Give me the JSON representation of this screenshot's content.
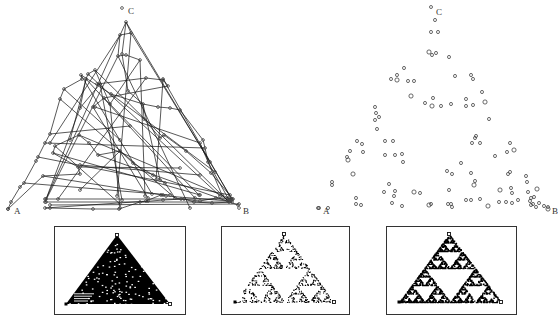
{
  "figure": {
    "left_panel": {
      "title": "Chaos game with connecting lines",
      "vertices": {
        "A": {
          "label": "A",
          "x": 8,
          "y": 209,
          "label_x": 14,
          "label_y": 214
        },
        "B": {
          "label": "B",
          "x": 239,
          "y": 208,
          "label_x": 243,
          "label_y": 214
        },
        "C": {
          "label": "C",
          "x": 122,
          "y": 8,
          "label_x": 128,
          "label_y": 14
        }
      },
      "path_points": [
        [
          126,
          22
        ],
        [
          131,
          33
        ],
        [
          120,
          35
        ],
        [
          118,
          56
        ],
        [
          126,
          55
        ],
        [
          140,
          60
        ],
        [
          110,
          104
        ],
        [
          95,
          70
        ],
        [
          88,
          74
        ],
        [
          86,
          79
        ],
        [
          80,
          108
        ],
        [
          100,
          84
        ],
        [
          97,
          84
        ],
        [
          146,
          78
        ],
        [
          163,
          80
        ],
        [
          163,
          79
        ],
        [
          168,
          86
        ],
        [
          104,
          98
        ],
        [
          93,
          107
        ],
        [
          95,
          107
        ],
        [
          200,
          143
        ],
        [
          222,
          195
        ],
        [
          228,
          201
        ],
        [
          229,
          201
        ],
        [
          166,
          196
        ],
        [
          161,
          195
        ],
        [
          146,
          201
        ],
        [
          148,
          201
        ],
        [
          45,
          208
        ],
        [
          50,
          208
        ],
        [
          93,
          209
        ],
        [
          119,
          209
        ],
        [
          140,
          202
        ],
        [
          163,
          200
        ],
        [
          184,
          199
        ],
        [
          194,
          202
        ],
        [
          212,
          203
        ],
        [
          232,
          202
        ],
        [
          229,
          200
        ],
        [
          208,
          162
        ],
        [
          205,
          148
        ],
        [
          203,
          140
        ],
        [
          180,
          110
        ],
        [
          170,
          108
        ],
        [
          158,
          107
        ],
        [
          143,
          104
        ],
        [
          111,
          94
        ],
        [
          81,
          75
        ],
        [
          82,
          79
        ],
        [
          64,
          89
        ],
        [
          60,
          99
        ],
        [
          50,
          134
        ],
        [
          45,
          143
        ],
        [
          38,
          157
        ],
        [
          36,
          161
        ],
        [
          24,
          183
        ],
        [
          20,
          187
        ],
        [
          11,
          202
        ],
        [
          8,
          209
        ],
        [
          43,
          176
        ],
        [
          80,
          174
        ],
        [
          78,
          167
        ],
        [
          53,
          153
        ],
        [
          55,
          146
        ],
        [
          79,
          135
        ],
        [
          89,
          143
        ],
        [
          98,
          155
        ],
        [
          120,
          151
        ],
        [
          133,
          163
        ],
        [
          153,
          175
        ],
        [
          165,
          183
        ],
        [
          175,
          198
        ],
        [
          181,
          199
        ],
        [
          200,
          201
        ],
        [
          216,
          198
        ],
        [
          228,
          198
        ],
        [
          233,
          199
        ],
        [
          211,
          173
        ],
        [
          186,
          151
        ],
        [
          164,
          135
        ],
        [
          160,
          138
        ],
        [
          144,
          119
        ],
        [
          143,
          104
        ],
        [
          128,
          91
        ],
        [
          122,
          54
        ],
        [
          126,
          22
        ]
      ],
      "extra_segments": [
        [
          [
            126,
            22
          ],
          [
            46,
            199
          ]
        ],
        [
          [
            126,
            22
          ],
          [
            232,
            199
          ]
        ],
        [
          [
            120,
            35
          ],
          [
            50,
            143
          ]
        ],
        [
          [
            118,
            56
          ],
          [
            45,
            202
          ]
        ],
        [
          [
            131,
            33
          ],
          [
            210,
            162
          ]
        ],
        [
          [
            95,
            70
          ],
          [
            228,
            201
          ]
        ],
        [
          [
            88,
            74
          ],
          [
            220,
            196
          ]
        ],
        [
          [
            86,
            79
          ],
          [
            195,
            198
          ]
        ],
        [
          [
            80,
            108
          ],
          [
            45,
            202
          ]
        ],
        [
          [
            104,
            98
          ],
          [
            199,
            195
          ]
        ],
        [
          [
            163,
            79
          ],
          [
            232,
            200
          ]
        ],
        [
          [
            146,
            78
          ],
          [
            58,
            199
          ]
        ],
        [
          [
            79,
            135
          ],
          [
            231,
            199
          ]
        ],
        [
          [
            53,
            153
          ],
          [
            200,
            195
          ]
        ],
        [
          [
            43,
            176
          ],
          [
            163,
            195
          ]
        ],
        [
          [
            45,
            143
          ],
          [
            205,
            148
          ]
        ],
        [
          [
            50,
            134
          ],
          [
            130,
            126
          ]
        ],
        [
          [
            64,
            89
          ],
          [
            120,
            140
          ]
        ],
        [
          [
            81,
            75
          ],
          [
            152,
            194
          ]
        ],
        [
          [
            110,
            104
          ],
          [
            120,
            208
          ]
        ],
        [
          [
            140,
            60
          ],
          [
            145,
            196
          ]
        ],
        [
          [
            118,
            56
          ],
          [
            190,
            208
          ]
        ],
        [
          [
            60,
            99
          ],
          [
            175,
            198
          ]
        ],
        [
          [
            38,
            157
          ],
          [
            230,
            195
          ]
        ],
        [
          [
            45,
            199
          ],
          [
            232,
            199
          ]
        ],
        [
          [
            46,
            202
          ],
          [
            229,
            202
          ]
        ],
        [
          [
            50,
            205
          ],
          [
            239,
            204
          ]
        ],
        [
          [
            80,
            165
          ],
          [
            200,
            175
          ]
        ],
        [
          [
            98,
            155
          ],
          [
            238,
            205
          ]
        ],
        [
          [
            120,
            151
          ],
          [
            80,
            190
          ]
        ],
        [
          [
            93,
            107
          ],
          [
            148,
            198
          ]
        ],
        [
          [
            163,
            80
          ],
          [
            156,
            180
          ]
        ],
        [
          [
            55,
            146
          ],
          [
            120,
            204
          ]
        ],
        [
          [
            24,
            183
          ],
          [
            170,
            195
          ]
        ],
        [
          [
            100,
            84
          ],
          [
            122,
            200
          ]
        ],
        [
          [
            86,
            79
          ],
          [
            70,
            140
          ]
        ],
        [
          [
            78,
            167
          ],
          [
            180,
            168
          ]
        ],
        [
          [
            111,
            94
          ],
          [
            215,
            172
          ]
        ],
        [
          [
            143,
            104
          ],
          [
            160,
            180
          ]
        ],
        [
          [
            131,
            33
          ],
          [
            117,
            196
          ]
        ]
      ]
    },
    "right_panel": {
      "title": "Chaos game points only",
      "vertices": {
        "A": {
          "label": "A",
          "x": 318,
          "y": 208,
          "label_x": 323,
          "label_y": 214
        },
        "B": {
          "label": "B",
          "x": 548,
          "y": 207,
          "label_x": 552,
          "label_y": 214
        },
        "C": {
          "label": "C",
          "x": 431,
          "y": 7,
          "label_x": 436,
          "label_y": 15
        }
      },
      "points": [
        [
          435,
          20
        ],
        [
          431,
          32
        ],
        [
          438,
          32
        ],
        [
          429,
          52
        ],
        [
          432,
          55
        ],
        [
          436,
          53
        ],
        [
          449,
          57
        ],
        [
          404,
          68
        ],
        [
          391,
          79
        ],
        [
          397,
          75
        ],
        [
          397,
          80
        ],
        [
          408,
          81
        ],
        [
          414,
          81
        ],
        [
          455,
          76
        ],
        [
          471,
          75
        ],
        [
          473,
          79
        ],
        [
          482,
          92
        ],
        [
          411,
          96
        ],
        [
          375,
          107
        ],
        [
          376,
          113
        ],
        [
          379,
          117
        ],
        [
          375,
          120
        ],
        [
          377,
          129
        ],
        [
          425,
          103
        ],
        [
          432,
          106
        ],
        [
          441,
          106
        ],
        [
          433,
          98
        ],
        [
          451,
          104
        ],
        [
          466,
          99
        ],
        [
          466,
          106
        ],
        [
          473,
          105
        ],
        [
          485,
          102
        ],
        [
          489,
          119
        ],
        [
          357,
          141
        ],
        [
          362,
          144
        ],
        [
          350,
          151
        ],
        [
          363,
          152
        ],
        [
          347,
          157
        ],
        [
          348,
          160
        ],
        [
          385,
          141
        ],
        [
          393,
          141
        ],
        [
          385,
          155
        ],
        [
          395,
          155
        ],
        [
          402,
          154
        ],
        [
          403,
          162
        ],
        [
          353,
          174
        ],
        [
          332,
          182
        ],
        [
          332,
          185
        ],
        [
          389,
          184
        ],
        [
          384,
          192
        ],
        [
          394,
          196
        ],
        [
          395,
          191
        ],
        [
          414,
          192
        ],
        [
          420,
          193
        ],
        [
          356,
          198
        ],
        [
          356,
          204
        ],
        [
          361,
          205
        ],
        [
          392,
          203
        ],
        [
          402,
          206
        ],
        [
          429,
          205
        ],
        [
          431,
          204
        ],
        [
          451,
          204
        ],
        [
          452,
          207
        ],
        [
          466,
          200
        ],
        [
          471,
          200
        ],
        [
          480,
          199
        ],
        [
          488,
          206
        ],
        [
          499,
          202
        ],
        [
          512,
          203
        ],
        [
          530,
          201
        ],
        [
          534,
          197
        ],
        [
          539,
          203
        ],
        [
          544,
          206
        ],
        [
          548,
          209
        ],
        [
          475,
          138
        ],
        [
          472,
          143
        ],
        [
          480,
          143
        ],
        [
          476,
          136
        ],
        [
          510,
          143
        ],
        [
          507,
          152
        ],
        [
          514,
          150
        ],
        [
          495,
          156
        ],
        [
          461,
          163
        ],
        [
          447,
          171
        ],
        [
          452,
          174
        ],
        [
          471,
          173
        ],
        [
          475,
          181
        ],
        [
          474,
          185
        ],
        [
          449,
          190
        ],
        [
          448,
          204
        ],
        [
          508,
          174
        ],
        [
          510,
          172
        ],
        [
          527,
          182
        ],
        [
          526,
          176
        ],
        [
          537,
          189
        ],
        [
          528,
          192
        ],
        [
          511,
          188
        ],
        [
          512,
          193
        ],
        [
          518,
          200
        ],
        [
          531,
          198
        ],
        [
          506,
          202
        ],
        [
          500,
          190
        ],
        [
          531,
          205
        ],
        [
          536,
          207
        ],
        [
          533,
          204
        ],
        [
          328,
          208
        ],
        [
          319,
          208
        ]
      ]
    },
    "thumbnails": [
      {
        "id": "dense",
        "caption": "Dense filled rendering",
        "frame": {
          "x": 54,
          "y": 226,
          "w": 131,
          "h": 88
        },
        "vertices": {
          "A": [
            66,
            304
          ],
          "B": [
            170,
            304
          ],
          "C": [
            117,
            235
          ]
        },
        "style": "filled"
      },
      {
        "id": "sparse",
        "caption": "Sparse fractal rendering",
        "frame": {
          "x": 221,
          "y": 226,
          "w": 128,
          "h": 88
        },
        "vertices": {
          "A": [
            235,
            302
          ],
          "B": [
            334,
            302
          ],
          "C": [
            284,
            234
          ]
        },
        "style": "sparse"
      },
      {
        "id": "medium",
        "caption": "Medium fractal rendering",
        "frame": {
          "x": 386,
          "y": 226,
          "w": 130,
          "h": 88
        },
        "vertices": {
          "A": [
            399,
            302
          ],
          "B": [
            501,
            302
          ],
          "C": [
            449,
            234
          ]
        },
        "style": "medium"
      }
    ]
  }
}
